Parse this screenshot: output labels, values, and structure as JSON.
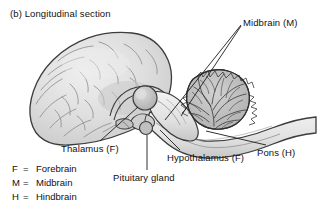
{
  "figure": {
    "panel_caption": "(b) Longitudinal section",
    "background_color": "#ffffff",
    "text_color": "#111111"
  },
  "labels": {
    "midbrain": "Midbrain (M)",
    "thalamus": "Thalamus (F)",
    "hypothalamus": "Hypothalamus (F)",
    "pons": "Pons (H)",
    "pituitary": "Pituitary gland"
  },
  "legend": {
    "rows": [
      {
        "key": "F",
        "eq": "=",
        "value": "Forebrain"
      },
      {
        "key": "M",
        "eq": "=",
        "value": "Midbrain"
      },
      {
        "key": "H",
        "eq": "=",
        "value": "Hindbrain"
      }
    ]
  },
  "illustration": {
    "name": "human-brain-midsagittal-section",
    "parts": [
      "cerebrum",
      "corpus-callosum",
      "thalamus",
      "hypothalamus",
      "pituitary-gland",
      "midbrain",
      "pons",
      "cerebellum",
      "medulla-spinal-cord"
    ],
    "colors": {
      "outline": "#3a3a3a",
      "cerebrum_fill": "#d9d9d9",
      "cerebrum_highlight": "#ececec",
      "brainstem_fill": "#e3e3e3",
      "cerebellum_fill": "#bdbdbd",
      "thalamus_fill": "#c4c4c4",
      "shadow": "#a8a8a8",
      "leader_line": "#1a1a1a"
    }
  }
}
